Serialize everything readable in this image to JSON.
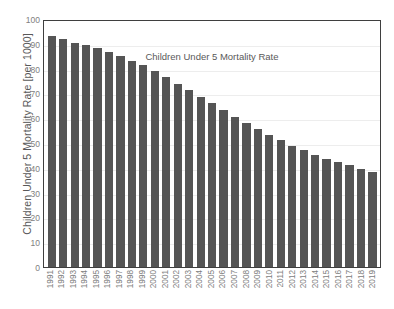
{
  "chart_data": {
    "type": "bar",
    "title": "Children Under 5 Mortality Rate",
    "xlabel": "",
    "ylabel": "Children Under 5 Mortality Rate [per 1000]",
    "ylim": [
      0,
      100
    ],
    "ytick_step": 10,
    "yticks": [
      100,
      90,
      80,
      70,
      60,
      50,
      40,
      30,
      20,
      10,
      0
    ],
    "grid": true,
    "legend": false,
    "bar_color": "#555555",
    "axis_color": "#3f3f3f",
    "gridline_color": "#ededed",
    "label_color": "#808080",
    "categories": [
      "1991",
      "1992",
      "1993",
      "1994",
      "1995",
      "1996",
      "1997",
      "1998",
      "1999",
      "2000",
      "2001",
      "2002",
      "2003",
      "2004",
      "2005",
      "2006",
      "2007",
      "2008",
      "2009",
      "2010",
      "2011",
      "2012",
      "2013",
      "2014",
      "2015",
      "2016",
      "2017",
      "2018",
      "2019"
    ],
    "values": [
      93.0,
      92.0,
      90.5,
      89.5,
      88.5,
      86.8,
      85.0,
      83.2,
      81.3,
      79.0,
      76.5,
      73.8,
      71.2,
      68.4,
      66.0,
      63.2,
      60.5,
      58.0,
      55.7,
      53.3,
      51.2,
      48.8,
      47.0,
      45.1,
      43.6,
      42.2,
      41.0,
      39.6,
      38.5
    ]
  }
}
